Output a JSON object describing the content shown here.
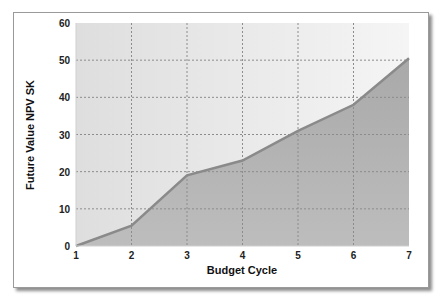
{
  "chart_data": {
    "type": "area",
    "title": "",
    "xlabel": "Budget Cycle",
    "ylabel": "Future Value NPV SK",
    "x": [
      1,
      2,
      3,
      4,
      5,
      6,
      7
    ],
    "categories": [
      "1",
      "2",
      "3",
      "4",
      "5",
      "6",
      "7"
    ],
    "series": [
      {
        "name": "Future Value NPV",
        "values": [
          0,
          5.5,
          19,
          23,
          31,
          38,
          50.5
        ]
      }
    ],
    "xlim": [
      1,
      7
    ],
    "ylim": [
      0,
      60
    ],
    "yticks": [
      0,
      10,
      20,
      30,
      40,
      50,
      60
    ],
    "xticks": [
      1,
      2,
      3,
      4,
      5,
      6,
      7
    ],
    "grid": true,
    "legend": "none",
    "colors": {
      "fill": "#b3b3b3",
      "line": "#8a8a8a",
      "plot_bg_left": "#dedede",
      "plot_bg_right": "#f5f5f5",
      "grid": "#8c8c8c"
    }
  }
}
